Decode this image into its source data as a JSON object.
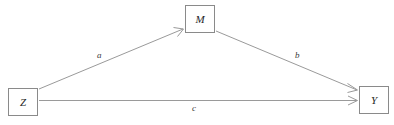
{
  "diagram": {
    "type": "mediation-path-diagram",
    "background_color": "#ffffff",
    "line_color": "#9a9a9a",
    "box_border_color": "#8a8a8a",
    "text_color": "#262626",
    "nodes": [
      {
        "id": "z",
        "label": "Z",
        "x": 8,
        "y": 88,
        "width": 30,
        "height": 28
      },
      {
        "id": "m",
        "label": "M",
        "x": 185,
        "y": 5,
        "width": 30,
        "height": 28
      },
      {
        "id": "y",
        "label": "Y",
        "x": 359,
        "y": 86,
        "width": 30,
        "height": 28
      }
    ],
    "edges": [
      {
        "id": "a",
        "label": "a",
        "from": "z",
        "to": "m",
        "arrowhead": true
      },
      {
        "id": "b",
        "label": "b",
        "from": "m",
        "to": "y",
        "arrowhead": true
      },
      {
        "id": "c",
        "label": "c",
        "from": "z",
        "to": "y",
        "arrowhead": true
      }
    ]
  }
}
